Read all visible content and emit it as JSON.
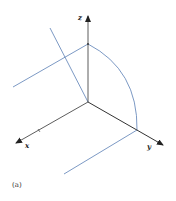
{
  "figure": {
    "caption": "(a)",
    "axes": {
      "x_label": "x",
      "y_label": "y",
      "z_label": "z"
    },
    "colors": {
      "axis": "#333333",
      "curve": "#5a7fb5",
      "background": "#ffffff"
    }
  }
}
